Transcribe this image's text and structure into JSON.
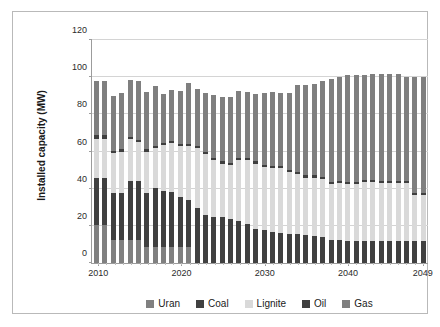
{
  "chart_data": {
    "type": "bar",
    "stacked": true,
    "title": "",
    "xlabel": "",
    "ylabel": "Installed capacity (MW)",
    "ylim": [
      0,
      120
    ],
    "yticks": [
      0,
      20,
      40,
      60,
      80,
      100,
      120
    ],
    "grid": true,
    "legend_position": "bottom",
    "categories": [
      "2010",
      "2011",
      "2012",
      "2013",
      "2014",
      "2015",
      "2016",
      "2017",
      "2018",
      "2019",
      "2020",
      "2021",
      "2022",
      "2023",
      "2024",
      "2025",
      "2026",
      "2027",
      "2028",
      "2029",
      "2030",
      "2031",
      "2032",
      "2033",
      "2034",
      "2035",
      "2036",
      "2037",
      "2038",
      "2039",
      "2040",
      "2041",
      "2042",
      "2043",
      "2044",
      "2045",
      "2046",
      "2047",
      "2048",
      "2049"
    ],
    "xtick_labels": [
      "2010",
      "2020",
      "2030",
      "2040",
      "2049"
    ],
    "series": [
      {
        "name": "Uran",
        "color": "#808080",
        "values": [
          20.5,
          20.5,
          12.5,
          12.5,
          12.5,
          12.5,
          8.5,
          8.5,
          8.5,
          8.5,
          8.5,
          8.5,
          0,
          0,
          0,
          0,
          0,
          0,
          0,
          0,
          0,
          0,
          0,
          0,
          0,
          0,
          0,
          0,
          0,
          0,
          0,
          0,
          0,
          0,
          0,
          0,
          0,
          0,
          0,
          0
        ]
      },
      {
        "name": "Coal",
        "color": "#404040",
        "values": [
          25.5,
          25.5,
          25.0,
          25.0,
          31.5,
          31.5,
          29.0,
          32.0,
          30.5,
          29.5,
          27.0,
          25.5,
          29.5,
          26.0,
          25.0,
          25.0,
          23.5,
          22.5,
          21.0,
          18.5,
          17.5,
          16.5,
          16.0,
          15.5,
          15.5,
          15.0,
          14.5,
          14.0,
          12.5,
          12.5,
          12.0,
          12.0,
          12.0,
          12.0,
          12.0,
          12.0,
          12.0,
          12.0,
          12.0,
          12.0
        ]
      },
      {
        "name": "Lignite",
        "color": "#d9d9d9",
        "values": [
          21.0,
          21.0,
          21.5,
          22.5,
          22.5,
          21.0,
          22.5,
          21.5,
          24.5,
          26.5,
          27.5,
          29.0,
          32.5,
          32.5,
          30.5,
          28.5,
          29.0,
          33.0,
          34.5,
          35.0,
          34.0,
          34.5,
          35.0,
          33.5,
          32.5,
          31.0,
          31.5,
          31.0,
          30.0,
          30.5,
          30.5,
          30.5,
          31.5,
          31.5,
          31.0,
          31.0,
          31.0,
          31.0,
          24.5,
          24.5
        ]
      },
      {
        "name": "Oil",
        "color": "#3f3f3f",
        "values": [
          2.0,
          2.0,
          1.2,
          1.2,
          1.2,
          1.2,
          1.2,
          1.2,
          1.2,
          1.2,
          1.2,
          1.2,
          1.2,
          1.2,
          1.2,
          1.2,
          1.2,
          1.2,
          1.2,
          1.2,
          1.2,
          1.2,
          1.2,
          1.2,
          1.2,
          1.2,
          1.2,
          1.2,
          1.2,
          1.2,
          1.2,
          1.2,
          1.2,
          1.2,
          1.2,
          1.2,
          1.2,
          1.2,
          1.2,
          1.2
        ]
      },
      {
        "name": "Gas",
        "color": "#7f7f7f",
        "values": [
          29.0,
          29.0,
          29.5,
          30.5,
          31.0,
          31.5,
          31.0,
          32.0,
          26.5,
          27.5,
          28.5,
          32.5,
          30.5,
          32.0,
          33.5,
          34.5,
          35.5,
          36.0,
          35.5,
          36.0,
          39.0,
          40.0,
          39.5,
          41.5,
          46.5,
          48.5,
          49.0,
          52.0,
          55.5,
          56.0,
          57.5,
          57.5,
          56.5,
          57.0,
          57.5,
          57.5,
          57.5,
          56.0,
          62.5,
          62.5
        ]
      }
    ],
    "legend": [
      {
        "label": "Uran",
        "color": "#808080"
      },
      {
        "label": "Coal",
        "color": "#404040"
      },
      {
        "label": "Lignite",
        "color": "#d9d9d9"
      },
      {
        "label": "Oil",
        "color": "#3f3f3f"
      },
      {
        "label": "Gas",
        "color": "#7f7f7f"
      }
    ]
  }
}
